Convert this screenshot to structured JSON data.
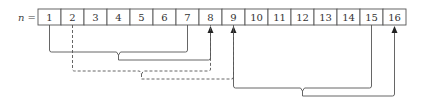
{
  "diagram": {
    "label": "n =",
    "cells": [
      "1",
      "2",
      "3",
      "4",
      "5",
      "6",
      "7",
      "8",
      "9",
      "10",
      "11",
      "12",
      "13",
      "14",
      "15",
      "16"
    ],
    "braces": [
      {
        "name": "group-1-to-7-to-8",
        "from_cells": [
          1,
          7
        ],
        "target_cell": 8,
        "style": "solid"
      },
      {
        "name": "group-2-to-8-to-9",
        "from_cells": [
          2,
          8
        ],
        "target_cell": 9,
        "style": "dashed"
      },
      {
        "name": "group-9-to-15-to-16",
        "from_cells": [
          9,
          15
        ],
        "target_cell": 16,
        "style": "solid"
      }
    ],
    "colors": {
      "line": "#555555",
      "cell_border": "#555555",
      "text": "#333333"
    }
  }
}
